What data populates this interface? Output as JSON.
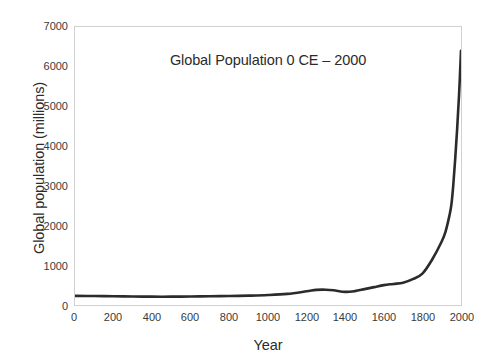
{
  "chart_data": {
    "type": "line",
    "title": "Global Population 0 CE – 2000",
    "xlabel": "Year",
    "ylabel": "Global population (millions)",
    "xlim": [
      0,
      2000
    ],
    "ylim": [
      0,
      7000
    ],
    "xticks": [
      0,
      200,
      400,
      600,
      800,
      1000,
      1200,
      1400,
      1600,
      1800,
      2000
    ],
    "xtick_labels": [
      "0",
      "200",
      "400",
      "600",
      "800",
      "1000",
      "1200",
      "1400",
      "1600",
      "1800",
      "2000"
    ],
    "yticks": [
      0,
      1000,
      2000,
      3000,
      4000,
      5000,
      6000,
      7000
    ],
    "ytick_labels": [
      "0",
      "1000",
      "2000",
      "3000",
      "4000",
      "5000",
      "6000",
      "7000"
    ],
    "grid": false,
    "legend": "none",
    "series": [
      {
        "name": "Global population",
        "color": "#2b2b2b",
        "line_width": 2.6,
        "x": [
          0,
          100,
          200,
          300,
          400,
          500,
          600,
          700,
          800,
          900,
          1000,
          1100,
          1200,
          1250,
          1300,
          1340,
          1400,
          1450,
          1500,
          1550,
          1600,
          1650,
          1700,
          1750,
          1800,
          1850,
          1900,
          1920,
          1940,
          1950,
          1960,
          1970,
          1980,
          1990,
          2000
        ],
        "y": [
          230,
          225,
          220,
          215,
          210,
          210,
          213,
          220,
          226,
          235,
          250,
          280,
          345,
          380,
          385,
          370,
          330,
          350,
          400,
          450,
          500,
          530,
          560,
          650,
          790,
          1140,
          1600,
          1850,
          2250,
          2520,
          3020,
          3680,
          4430,
          5300,
          6400
        ]
      }
    ]
  }
}
